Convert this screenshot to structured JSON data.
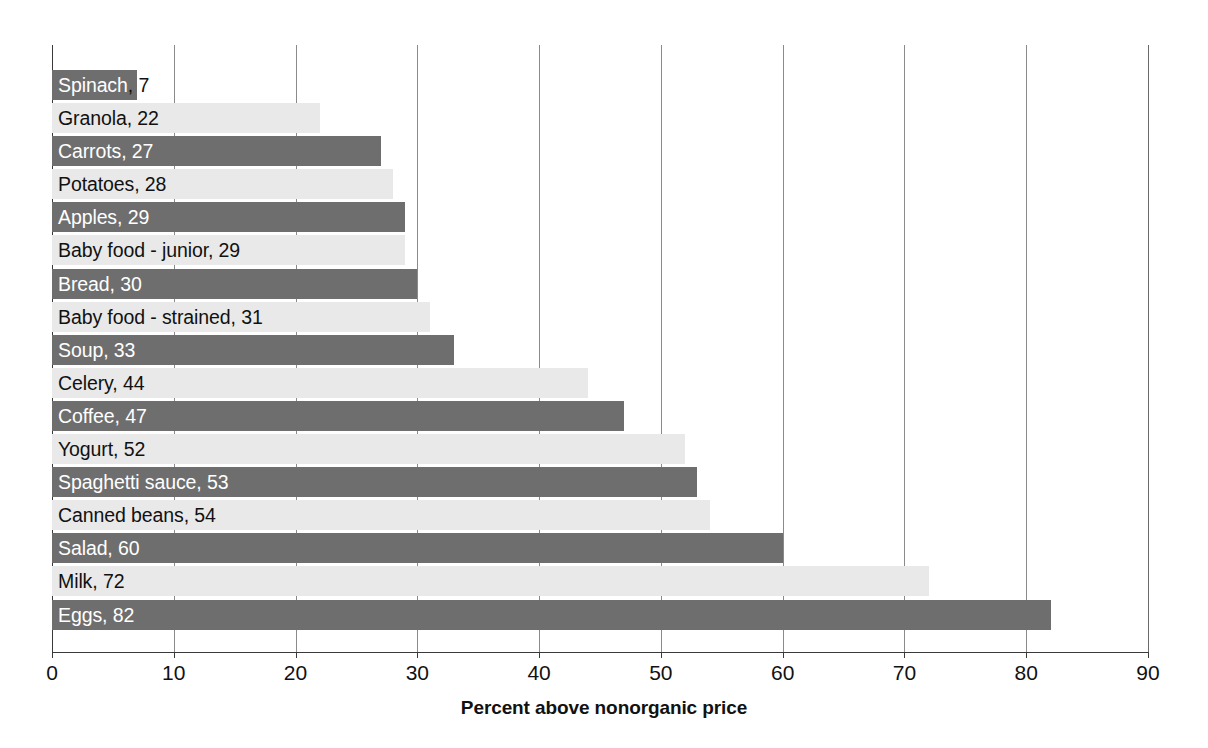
{
  "chart_data": {
    "type": "bar",
    "orientation": "horizontal",
    "title": "",
    "subtitle": "",
    "xlabel": "Percent above nonorganic price",
    "ylabel": "",
    "xlim": [
      0,
      90
    ],
    "xticks": [
      0,
      10,
      20,
      30,
      40,
      50,
      60,
      70,
      80,
      90
    ],
    "xtick_labels": [
      "0",
      "10",
      "20",
      "30",
      "40",
      "50",
      "60",
      "70",
      "80",
      "90"
    ],
    "grid": "vertical-only",
    "legend": "none",
    "categories": [
      "Spinach",
      "Granola",
      "Carrots",
      "Potatoes",
      "Apples",
      "Baby food - junior",
      "Bread",
      "Baby food - strained",
      "Soup",
      "Celery",
      "Coffee",
      "Yogurt",
      "Spaghetti sauce",
      "Canned beans",
      "Salad",
      "Milk",
      "Eggs"
    ],
    "values": [
      7,
      22,
      27,
      28,
      29,
      29,
      30,
      31,
      33,
      44,
      47,
      52,
      53,
      54,
      60,
      72,
      82
    ],
    "data_labels": [
      "Spinach, 7",
      "Granola, 22",
      "Carrots, 27",
      "Potatoes, 28",
      "Apples, 29",
      "Baby food - junior, 29",
      "Bread, 30",
      "Baby food - strained, 31",
      "Soup, 33",
      "Celery, 44",
      "Coffee, 47",
      "Yogurt, 52",
      "Spaghetti sauce, 53",
      "Canned beans, 54",
      "Salad, 60",
      "Milk, 72",
      "Eggs, 82"
    ],
    "bar_styles": [
      "dark",
      "light",
      "dark",
      "light",
      "dark",
      "light",
      "dark",
      "light",
      "dark",
      "light",
      "dark",
      "light",
      "dark",
      "light",
      "dark",
      "light",
      "dark"
    ],
    "colors": {
      "dark_bar": "#6e6e6e",
      "light_bar": "#e9e9e9",
      "gridline": "#8a8a8a",
      "axis": "#3a3a3a",
      "label_on_dark": "#ffffff",
      "label_on_light": "#111111",
      "background": "#ffffff"
    }
  }
}
